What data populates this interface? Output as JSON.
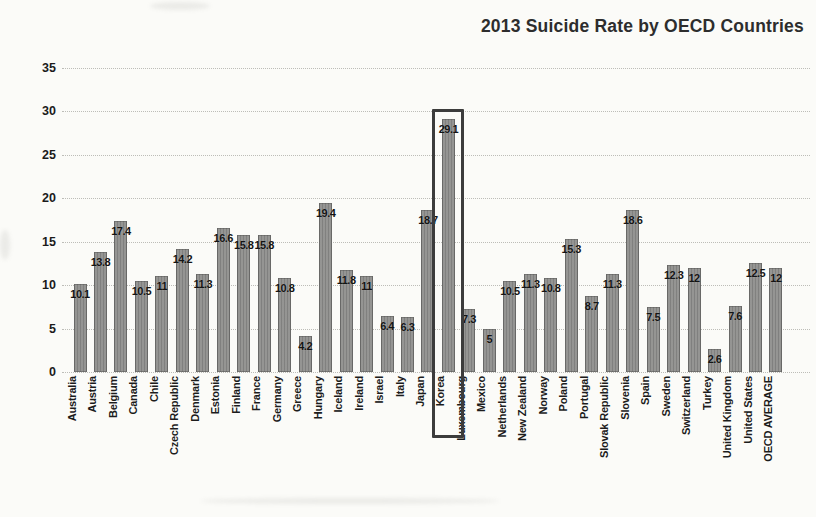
{
  "title": "2013 Suicide Rate by OECD Countries",
  "chart_data": {
    "type": "bar",
    "title": "2013 Suicide Rate by OECD Countries",
    "xlabel": "",
    "ylabel": "",
    "ylim": [
      0,
      35
    ],
    "yticks": [
      0,
      5,
      10,
      15,
      20,
      25,
      30,
      35
    ],
    "grid": true,
    "grid_style": "dotted",
    "legend": "none",
    "bar_color": "#8f8f8d",
    "label_color": "#141414",
    "categories": [
      "Australia",
      "Austria",
      "Belgium",
      "Canada",
      "Chile",
      "Czech Republic",
      "Denmark",
      "Estonia",
      "Finland",
      "France",
      "Germany",
      "Greece",
      "Hungary",
      "Iceland",
      "Ireland",
      "Israel",
      "Italy",
      "Japan",
      "Korea",
      "Luxembourg",
      "Mexico",
      "Netherlands",
      "New Zealand",
      "Norway",
      "Poland",
      "Portugal",
      "Slovak Republic",
      "Slovenia",
      "Spain",
      "Sweden",
      "Switzerland",
      "Turkey",
      "United Kingdom",
      "United States",
      "OECD AVERAGE"
    ],
    "values": [
      10.1,
      13.8,
      17.4,
      10.5,
      11,
      14.2,
      11.3,
      16.6,
      15.8,
      15.8,
      10.8,
      4.2,
      19.4,
      11.8,
      11,
      6.4,
      6.3,
      18.7,
      29.1,
      7.3,
      5,
      10.5,
      11.3,
      10.8,
      15.3,
      8.7,
      11.3,
      18.6,
      7.5,
      12.3,
      12,
      2.6,
      7.6,
      12.5,
      12
    ],
    "highlight": {
      "category": "Korea",
      "box_color": "#3c3c3c"
    }
  }
}
